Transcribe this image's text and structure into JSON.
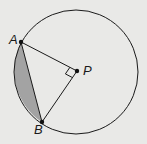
{
  "diagram": {
    "type": "circle-geometry",
    "colors": {
      "background": "#e9e9e7",
      "stroke": "#1a1a1a",
      "segment_fill": "#a3a3a3"
    },
    "circle": {
      "cx": 76,
      "cy": 72,
      "r": 62
    },
    "points": {
      "A": {
        "label": "A",
        "x": 21,
        "y": 42,
        "label_x": 9,
        "label_y": 44
      },
      "P": {
        "label": "P",
        "x": 77,
        "y": 71,
        "label_x": 83,
        "label_y": 75
      },
      "B": {
        "label": "B",
        "x": 42,
        "y": 122,
        "label_x": 34,
        "label_y": 134
      }
    },
    "segments": [
      "AP",
      "BP",
      "AB"
    ],
    "right_angle_at": "P",
    "shaded_region": "minor segment between chord AB and arc AB"
  }
}
